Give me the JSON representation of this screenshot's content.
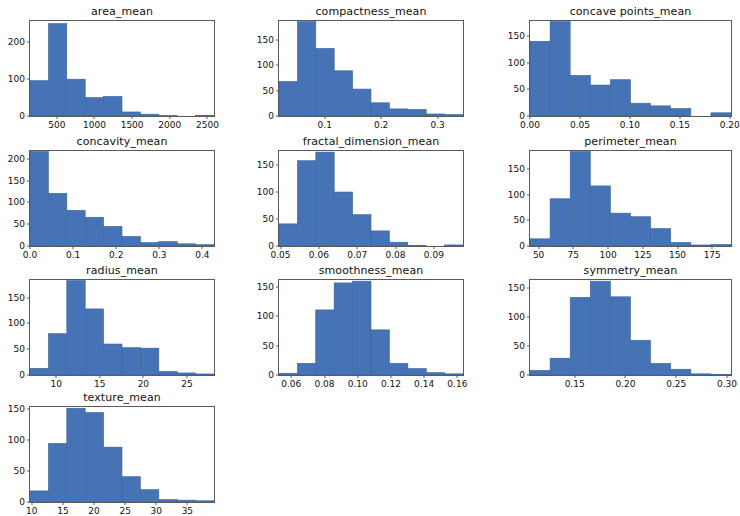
{
  "figure": {
    "width": 732,
    "height": 511,
    "background": "#ffffff",
    "bar_color": "#4573b5",
    "bar_edge_color": "#3b65a0",
    "axis_color": "#5a5a5a",
    "text_color": "#111111",
    "layout": {
      "rows": 4,
      "cols": 3
    }
  },
  "chart_data": [
    {
      "type": "bar",
      "title": "area_mean",
      "xlabel": "",
      "ylabel": "",
      "grid": false,
      "legend": null,
      "xlim": [
        143.5,
        2587.5
      ],
      "ylim": [
        0,
        258
      ],
      "xticks": [
        500,
        1000,
        1500,
        2000,
        2500
      ],
      "xticklabels": [
        "500",
        "1000",
        "1500",
        "2000",
        "2500"
      ],
      "yticks": [
        0,
        100,
        200
      ],
      "yticklabels": [
        "0",
        "100",
        "200"
      ],
      "bin_edges": [
        143.5,
        387.9,
        632.3,
        876.7,
        1121.1,
        1365.5,
        1609.9,
        1854.3,
        2098.7,
        2343.1,
        2587.5
      ],
      "values": [
        96,
        251,
        100,
        50,
        53,
        11,
        5,
        1,
        0,
        2
      ]
    },
    {
      "type": "bar",
      "title": "compactness_mean",
      "xlabel": "",
      "ylabel": "",
      "grid": false,
      "legend": null,
      "xlim": [
        0.019,
        0.345
      ],
      "ylim": [
        0,
        187
      ],
      "xticks": [
        0.1,
        0.2,
        0.3
      ],
      "xticklabels": [
        "0.1",
        "0.2",
        "0.3"
      ],
      "yticks": [
        0,
        50,
        100,
        150
      ],
      "yticklabels": [
        "0",
        "50",
        "100",
        "150"
      ],
      "bin_edges": [
        0.019,
        0.0516,
        0.0842,
        0.1168,
        0.1494,
        0.182,
        0.2146,
        0.2472,
        0.2798,
        0.3124,
        0.345
      ],
      "values": [
        68,
        186,
        133,
        89,
        53,
        26,
        14,
        13,
        4,
        3
      ]
    },
    {
      "type": "bar",
      "title": "concave points_mean",
      "xlabel": "",
      "ylabel": "",
      "grid": false,
      "legend": null,
      "xlim": [
        0.0,
        0.2012
      ],
      "ylim": [
        0,
        178
      ],
      "xticks": [
        0.0,
        0.05,
        0.1,
        0.15,
        0.2
      ],
      "xticklabels": [
        "0.00",
        "0.05",
        "0.10",
        "0.15",
        "0.20"
      ],
      "yticks": [
        0,
        50,
        100,
        150
      ],
      "yticklabels": [
        "0",
        "50",
        "100",
        "150"
      ],
      "bin_edges": [
        0.0,
        0.0201,
        0.0402,
        0.0604,
        0.0805,
        0.1006,
        0.1207,
        0.1408,
        0.161,
        0.1811,
        0.2012
      ],
      "values": [
        140,
        177,
        76,
        58,
        68,
        24,
        19,
        14,
        0,
        6
      ]
    },
    {
      "type": "bar",
      "title": "concavity_mean",
      "xlabel": "",
      "ylabel": "",
      "grid": false,
      "legend": null,
      "xlim": [
        0.0,
        0.4268
      ],
      "ylim": [
        0,
        218
      ],
      "xticks": [
        0.0,
        0.1,
        0.2,
        0.3,
        0.4
      ],
      "xticklabels": [
        "0.0",
        "0.1",
        "0.2",
        "0.3",
        "0.4"
      ],
      "yticks": [
        0,
        50,
        100,
        150,
        200
      ],
      "yticklabels": [
        "0",
        "50",
        "100",
        "150",
        "200"
      ],
      "bin_edges": [
        0.0,
        0.0427,
        0.0854,
        0.128,
        0.1707,
        0.2134,
        0.2561,
        0.2988,
        0.3415,
        0.3841,
        0.4268
      ],
      "values": [
        217,
        121,
        82,
        66,
        45,
        22,
        8,
        10,
        5,
        3
      ]
    },
    {
      "type": "bar",
      "title": "fractal_dimension_mean",
      "xlabel": "",
      "ylabel": "",
      "grid": false,
      "legend": null,
      "xlim": [
        0.0496,
        0.0976
      ],
      "ylim": [
        0,
        176
      ],
      "xticks": [
        0.05,
        0.06,
        0.07,
        0.08,
        0.09
      ],
      "xticklabels": [
        "0.05",
        "0.06",
        "0.07",
        "0.08",
        "0.09"
      ],
      "yticks": [
        0,
        50,
        100,
        150
      ],
      "yticklabels": [
        "0",
        "50",
        "100",
        "150"
      ],
      "bin_edges": [
        0.0496,
        0.0544,
        0.0592,
        0.064,
        0.0688,
        0.0736,
        0.0784,
        0.0832,
        0.088,
        0.0928,
        0.0976
      ],
      "values": [
        41,
        158,
        174,
        100,
        58,
        28,
        7,
        1,
        0,
        2
      ]
    },
    {
      "type": "bar",
      "title": "perimeter_mean",
      "xlabel": "",
      "ylabel": "",
      "grid": false,
      "legend": null,
      "xlim": [
        43.79,
        188.5
      ],
      "ylim": [
        0,
        185
      ],
      "xticks": [
        50,
        75,
        100,
        125,
        150,
        175
      ],
      "xticklabels": [
        "50",
        "75",
        "100",
        "125",
        "150",
        "175"
      ],
      "yticks": [
        0,
        50,
        100,
        150
      ],
      "yticklabels": [
        "0",
        "50",
        "100",
        "150"
      ],
      "bin_edges": [
        43.79,
        58.26,
        72.73,
        87.2,
        101.67,
        116.14,
        130.61,
        145.08,
        159.55,
        174.02,
        188.5
      ],
      "values": [
        14,
        92,
        184,
        117,
        64,
        57,
        34,
        7,
        2,
        3
      ]
    },
    {
      "type": "bar",
      "title": "radius_mean",
      "xlabel": "",
      "ylabel": "",
      "grid": false,
      "legend": null,
      "xlim": [
        6.981,
        28.11
      ],
      "ylim": [
        0,
        184
      ],
      "xticks": [
        10,
        15,
        20,
        25
      ],
      "xticklabels": [
        "10",
        "15",
        "20",
        "25"
      ],
      "yticks": [
        0,
        50,
        100,
        150
      ],
      "yticklabels": [
        "0",
        "50",
        "100",
        "150"
      ],
      "bin_edges": [
        6.981,
        9.094,
        11.207,
        13.32,
        15.433,
        17.546,
        19.659,
        21.772,
        23.885,
        25.998,
        28.11
      ],
      "values": [
        13,
        80,
        183,
        128,
        60,
        53,
        52,
        7,
        4,
        2
      ]
    },
    {
      "type": "bar",
      "title": "smoothness_mean",
      "xlabel": "",
      "ylabel": "",
      "grid": false,
      "legend": null,
      "xlim": [
        0.0526,
        0.1634
      ],
      "ylim": [
        0,
        162
      ],
      "xticks": [
        0.06,
        0.08,
        0.1,
        0.12,
        0.14,
        0.16
      ],
      "xticklabels": [
        "0.06",
        "0.08",
        "0.10",
        "0.12",
        "0.14",
        "0.16"
      ],
      "yticks": [
        0,
        50,
        100,
        150
      ],
      "yticklabels": [
        "0",
        "50",
        "100",
        "150"
      ],
      "bin_edges": [
        0.0526,
        0.0637,
        0.0747,
        0.0858,
        0.0969,
        0.108,
        0.1191,
        0.1302,
        0.1413,
        0.1523,
        0.1634
      ],
      "values": [
        3,
        20,
        111,
        157,
        160,
        77,
        20,
        11,
        4,
        2
      ]
    },
    {
      "type": "bar",
      "title": "symmetry_mean",
      "xlabel": "",
      "ylabel": "",
      "grid": false,
      "legend": null,
      "xlim": [
        0.106,
        0.304
      ],
      "ylim": [
        0,
        164
      ],
      "xticks": [
        0.1,
        0.15,
        0.2,
        0.25,
        0.3
      ],
      "xticklabels": [
        "0.10",
        "0.15",
        "0.20",
        "0.25",
        "0.30"
      ],
      "yticks": [
        0,
        50,
        100,
        150
      ],
      "yticklabels": [
        "0",
        "50",
        "100",
        "150"
      ],
      "bin_edges": [
        0.106,
        0.1258,
        0.1456,
        0.1654,
        0.1852,
        0.205,
        0.2248,
        0.2446,
        0.2644,
        0.2842,
        0.304
      ],
      "values": [
        8,
        29,
        134,
        162,
        135,
        60,
        20,
        10,
        2,
        1
      ]
    },
    {
      "type": "bar",
      "title": "texture_mean",
      "xlabel": "",
      "ylabel": "",
      "grid": false,
      "legend": null,
      "xlim": [
        9.71,
        39.28
      ],
      "ylim": [
        0,
        154
      ],
      "xticks": [
        10,
        15,
        20,
        25,
        30,
        35,
        40
      ],
      "xticklabels": [
        "10",
        "15",
        "20",
        "25",
        "30",
        "35",
        "40"
      ],
      "yticks": [
        0,
        50,
        100,
        150
      ],
      "yticklabels": [
        "0",
        "50",
        "100",
        "150"
      ],
      "bin_edges": [
        9.71,
        12.667,
        15.624,
        18.581,
        21.538,
        24.495,
        27.452,
        30.409,
        33.366,
        36.323,
        39.28
      ],
      "values": [
        18,
        95,
        152,
        145,
        89,
        41,
        20,
        4,
        3,
        2
      ]
    }
  ]
}
